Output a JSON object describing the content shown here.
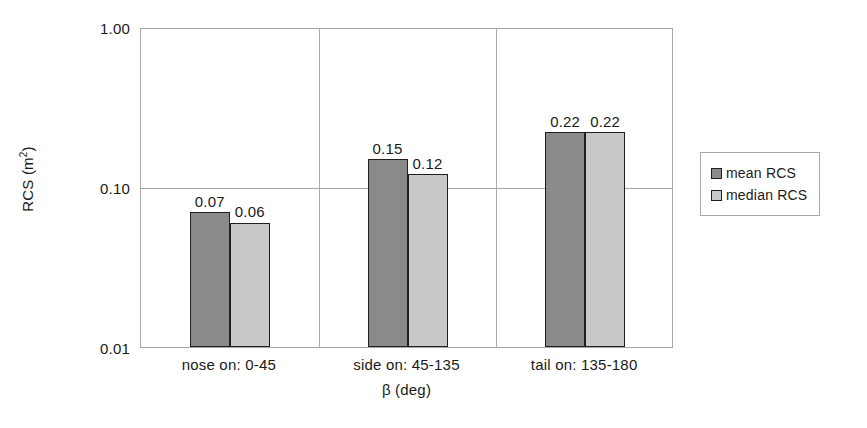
{
  "chart_data": {
    "type": "bar",
    "title": "",
    "xlabel": "β (deg)",
    "ylabel": "RCS (m²)",
    "ylabel_base": "RCS (m",
    "ylabel_sup": "2",
    "ylabel_tail": ")",
    "yscale": "log",
    "ylim": [
      0.01,
      1.0
    ],
    "ytick_labels": [
      "1.00",
      "0.10",
      "0.01"
    ],
    "ytick_values": [
      1.0,
      0.1,
      0.01
    ],
    "grid": true,
    "legend_position": "right",
    "categories": [
      "nose on:  0-45",
      "side on: 45-135",
      "tail on: 135-180"
    ],
    "series": [
      {
        "name": "mean RCS",
        "color": "#8a8a8a",
        "values": [
          0.07,
          0.15,
          0.22
        ],
        "labels": [
          "0.07",
          "0.15",
          "0.22"
        ]
      },
      {
        "name": "median RCS",
        "color": "#c9c9c9",
        "values": [
          0.06,
          0.12,
          0.22
        ],
        "labels": [
          "0.06",
          "0.12",
          "0.22"
        ]
      }
    ]
  },
  "legend": {
    "entries": [
      {
        "label": "mean RCS",
        "color": "#8a8a8a"
      },
      {
        "label": "median RCS",
        "color": "#c9c9c9"
      }
    ]
  },
  "colors": {
    "mean": "#8a8a8a",
    "median": "#c9c9c9",
    "axis": "#a8a8a8",
    "bar_outline": "#1f1f1f",
    "background": "#ffffff",
    "text": "#1a1a1a"
  }
}
